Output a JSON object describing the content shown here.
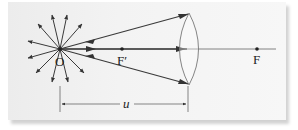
{
  "diagram": {
    "type": "ray-diagram-converging-lens",
    "labels": {
      "object_point": "O",
      "focal_point_front": "F′",
      "focal_point_back": "F",
      "object_distance": "u"
    },
    "colors": {
      "panel": "#f1f1f1",
      "ray": "#3a3a3a",
      "axis": "#555555",
      "lens": "#777777"
    },
    "elements": {
      "burst_arrow_count": 12,
      "rays_to_lens": 3
    }
  }
}
